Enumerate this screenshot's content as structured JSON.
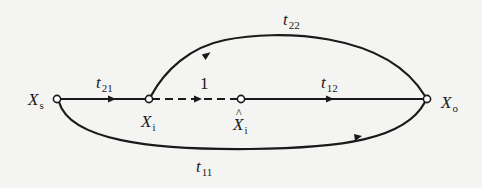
{
  "diagram": {
    "type": "signal-flow-graph",
    "colors": {
      "line": "#1a1a1a",
      "background": "#f4f4f2",
      "node_fill": "#ffffff"
    },
    "nodes": [
      {
        "id": "Xs",
        "base": "X",
        "sub": "s",
        "hat": false,
        "x": 57,
        "y": 99
      },
      {
        "id": "Xi",
        "base": "X",
        "sub": "i",
        "hat": false,
        "x": 149,
        "y": 99
      },
      {
        "id": "Xi_hat",
        "base": "X",
        "sub": "i",
        "hat": true,
        "x": 241,
        "y": 99
      },
      {
        "id": "Xo",
        "base": "X",
        "sub": "o",
        "hat": false,
        "x": 427,
        "y": 99
      }
    ],
    "edges": [
      {
        "id": "t21",
        "from": "Xs",
        "to": "Xi",
        "label_base": "t",
        "label_sub": "21",
        "style": "solid"
      },
      {
        "id": "one",
        "from": "Xi",
        "to": "Xi_hat",
        "label": "1",
        "style": "dashed"
      },
      {
        "id": "t12",
        "from": "Xi_hat",
        "to": "Xo",
        "label_base": "t",
        "label_sub": "12",
        "style": "solid"
      },
      {
        "id": "t22",
        "from": "Xo",
        "to": "Xi",
        "label_base": "t",
        "label_sub": "22",
        "style": "solid-arc-top"
      },
      {
        "id": "t11",
        "from": "Xs",
        "to": "Xo",
        "label_base": "t",
        "label_sub": "11",
        "style": "solid-arc-bottom"
      }
    ]
  }
}
